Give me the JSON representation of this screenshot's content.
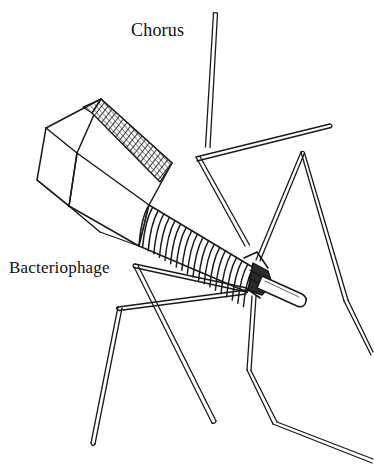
{
  "figure": {
    "kind": "line-drawing",
    "background_color": "#ffffff",
    "ink_color": "#1a1a1a",
    "width": 374,
    "height": 472
  },
  "labels": {
    "chorus": "Chorus",
    "bacteriophage": "Bacteriophage"
  },
  "parts": {
    "head": "icosahedral-capsid-head",
    "collar": "hatched-facet",
    "sheath": "contractile-tail-sheath",
    "baseplate": "baseplate",
    "core": "tail-core-tube",
    "fibers": "tail-fibers"
  },
  "sheath": {
    "ring_count": 19
  }
}
